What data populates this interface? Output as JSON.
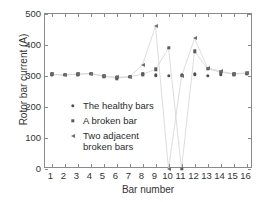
{
  "chart_data": {
    "type": "scatter",
    "title": "",
    "xlabel": "Bar number",
    "ylabel": "Rotor bar current (A)",
    "xlim": [
      0.5,
      16.5
    ],
    "ylim": [
      0,
      500
    ],
    "ytick_values": [
      0,
      100,
      200,
      300,
      400,
      500
    ],
    "ytick_labels": [
      "0",
      "100",
      "200",
      "300",
      "400",
      "500"
    ],
    "xtick_values": [
      1,
      2,
      3,
      4,
      5,
      6,
      7,
      8,
      9,
      10,
      11,
      12,
      13,
      14,
      15,
      16
    ],
    "xtick_labels": [
      "1",
      "2",
      "3",
      "4",
      "5",
      "6",
      "7",
      "8",
      "9",
      "10",
      "11",
      "12",
      "13",
      "14",
      "15",
      "16"
    ],
    "grid": false,
    "legend_position": "lower-left-inside",
    "categories": [
      1,
      2,
      3,
      4,
      5,
      6,
      7,
      8,
      9,
      10,
      11,
      12,
      13,
      14,
      15,
      16
    ],
    "series": [
      {
        "name": "The healthy bars",
        "marker": "dot",
        "color": "#4d4d4d",
        "values": [
          305,
          303,
          306,
          308,
          300,
          296,
          298,
          305,
          302,
          300,
          302,
          306,
          301,
          303,
          305,
          308
        ]
      },
      {
        "name": "A broken bar",
        "marker": "square",
        "color": "#5a5a5a",
        "values": [
          305,
          303,
          306,
          308,
          299,
          293,
          297,
          306,
          321,
          390,
          0,
          380,
          324,
          312,
          306,
          309
        ]
      },
      {
        "name": "Two adjacent broken bars",
        "marker": "triangle-left",
        "color": "#6e6e6e",
        "values": [
          305,
          303,
          306,
          308,
          300,
          296,
          298,
          336,
          461,
          0,
          299,
          421,
          327,
          315,
          307,
          310
        ]
      }
    ]
  },
  "legend": {
    "entries": [
      {
        "label": "The healthy bars",
        "marker": "dot-marker"
      },
      {
        "label": "A broken bar",
        "marker": "square-marker"
      },
      {
        "label": "Two adjacent\nbroken bars",
        "marker": "triangle-left-marker"
      }
    ]
  },
  "axes": {
    "x_title": "Bar number",
    "y_title": "Rotor bar current (A)"
  },
  "colors": {
    "background": "#ffffff",
    "axis": "#8a8a8a",
    "text": "#333333",
    "series_healthy": "#4d4d4d",
    "series_one_broken": "#5a5a5a",
    "series_two_broken": "#6e6e6e",
    "connector_line": "#cfcfcf"
  }
}
